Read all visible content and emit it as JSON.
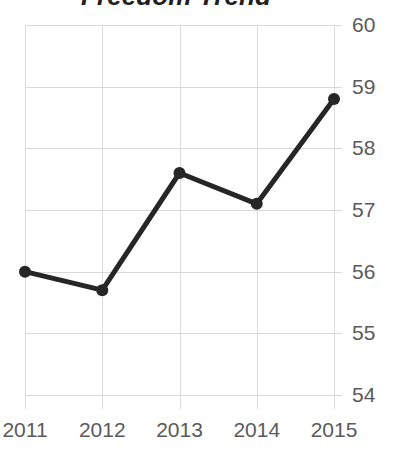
{
  "chart_data": {
    "type": "line",
    "title": "Freedom Trend",
    "xlabel": "",
    "ylabel": "",
    "categories": [
      "2011",
      "2012",
      "2013",
      "2014",
      "2015"
    ],
    "x": [
      2011,
      2012,
      2013,
      2014,
      2015
    ],
    "values": [
      56.0,
      55.7,
      57.6,
      57.1,
      58.8
    ],
    "series": [
      {
        "name": "Freedom Trend",
        "values": [
          56.0,
          55.7,
          57.6,
          57.1,
          58.8
        ]
      }
    ],
    "ylim": [
      54,
      60
    ],
    "yticks": [
      60,
      59,
      58,
      57,
      56,
      55,
      54
    ],
    "ytick_labels": [
      "60",
      "59",
      "58",
      "57",
      "56",
      "55",
      "54"
    ],
    "xticks": [
      2011,
      2012,
      2013,
      2014,
      2015
    ],
    "xtick_labels": [
      "2011",
      "2012",
      "2013",
      "2014",
      "2015"
    ],
    "grid": true,
    "y_axis_position": "right",
    "legend": false,
    "legend_position": "none",
    "markers": true,
    "line_color": "#262626",
    "marker_color": "#262626",
    "grid_color": "#d9d9d9",
    "tick_label_color": "#5a5a5a",
    "title_color": "#231f20",
    "background_color": "#ffffff"
  }
}
